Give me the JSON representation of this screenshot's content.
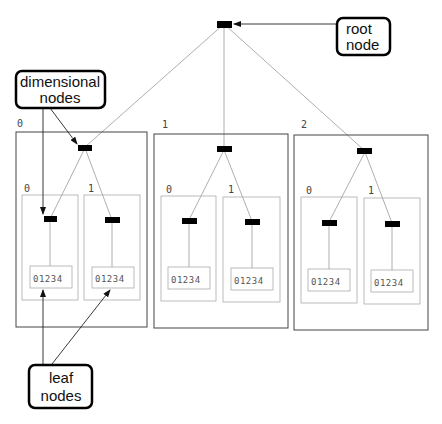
{
  "callouts": {
    "root": {
      "line1": "root",
      "line2": "node"
    },
    "dimensional": {
      "line1": "dimensional",
      "line2": "nodes"
    },
    "leaf": {
      "line1": "leaf",
      "line2": "nodes"
    }
  },
  "blocks": [
    {
      "index": "0",
      "children": [
        {
          "index": "0",
          "leaf": "01234"
        },
        {
          "index": "1",
          "leaf": "01234"
        }
      ]
    },
    {
      "index": "1",
      "children": [
        {
          "index": "0",
          "leaf": "01234"
        },
        {
          "index": "1",
          "leaf": "01234"
        }
      ]
    },
    {
      "index": "2",
      "children": [
        {
          "index": "0",
          "leaf": "01234"
        },
        {
          "index": "1",
          "leaf": "01234"
        }
      ]
    }
  ],
  "colors": {
    "node": "#000000",
    "outer_box": "#444444",
    "inner_box": "#aaaaaa",
    "edge": "#999999",
    "arrow": "#222222"
  }
}
